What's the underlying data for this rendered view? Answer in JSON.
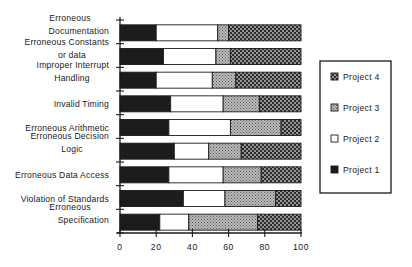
{
  "chart_data": {
    "type": "bar",
    "orientation": "horizontal",
    "stacked": true,
    "title": "",
    "xlabel": "",
    "ylabel": "",
    "xlim": [
      0,
      100
    ],
    "x_ticks": [
      0,
      20,
      40,
      60,
      80,
      100
    ],
    "grid": false,
    "legend_position": "right",
    "categories": [
      [
        "Erroneous",
        "Documentation"
      ],
      [
        "Erroneous Constants",
        "or data"
      ],
      [
        "Improper Interrupt",
        "Handling"
      ],
      [
        "Invalid Timing"
      ],
      [
        "Erroneous Arithmetic"
      ],
      [
        "Erroneous Decision",
        "Logic"
      ],
      [
        "Erroneous Data Access"
      ],
      [
        "Violation of Standards"
      ],
      [
        "Erroneous",
        "Specification"
      ]
    ],
    "series": [
      {
        "name": "Project 1",
        "fill": "black",
        "values": [
          20,
          24,
          20,
          28,
          27,
          30,
          27,
          35,
          22
        ]
      },
      {
        "name": "Project 2",
        "fill": "white",
        "values": [
          34,
          29,
          31,
          29,
          34,
          19,
          30,
          23,
          16
        ]
      },
      {
        "name": "Project 3",
        "fill": "gray-stipple",
        "values": [
          6,
          8,
          13,
          20,
          28,
          18,
          21,
          28,
          38
        ]
      },
      {
        "name": "Project 4",
        "fill": "dark-dotted",
        "values": [
          40,
          39,
          36,
          23,
          11,
          33,
          22,
          14,
          24
        ]
      }
    ],
    "legend_order": [
      "Project 4",
      "Project 3",
      "Project 2",
      "Project 1"
    ]
  },
  "colors": {
    "ink": "#1a1a1a",
    "project1": "#1c1c1c",
    "project2": "#ffffff",
    "project3_bg": "#b8b8b8",
    "project3_dot": "#5a5a5a",
    "project4_bg": "#2a2a2a",
    "project4_dot": "#bdbdbd"
  }
}
